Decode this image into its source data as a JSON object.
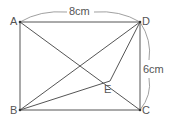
{
  "diagram": {
    "type": "geometry",
    "shape": "rectangle ABCD with point E",
    "points": {
      "A": {
        "label": "A",
        "x": 20,
        "y": 22
      },
      "B": {
        "label": "B",
        "x": 20,
        "y": 110
      },
      "C": {
        "label": "C",
        "x": 140,
        "y": 110
      },
      "D": {
        "label": "D",
        "x": 140,
        "y": 22
      },
      "E": {
        "label": "E",
        "x": 110,
        "y": 81
      }
    },
    "segments": [
      "AB",
      "BC",
      "CD",
      "DA",
      "AC",
      "BD",
      "BE",
      "DE"
    ],
    "dimensions": {
      "top": "8cm",
      "right": "6cm"
    },
    "stroke_color": "#555555"
  }
}
